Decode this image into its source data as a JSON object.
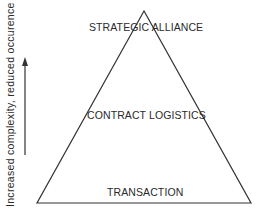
{
  "diagram": {
    "type": "pyramid",
    "levels": [
      {
        "label": "STRATEGIC ALLIANCE",
        "position": "top"
      },
      {
        "label": "CONTRACT LOGISTICS",
        "position": "middle"
      },
      {
        "label": "TRANSACTION",
        "position": "bottom"
      }
    ],
    "axis": {
      "label": "Increased complexity, reduced occurence",
      "direction": "up"
    },
    "colors": {
      "line": "#333333",
      "text": "#2a2a2a",
      "background": "#ffffff"
    }
  }
}
